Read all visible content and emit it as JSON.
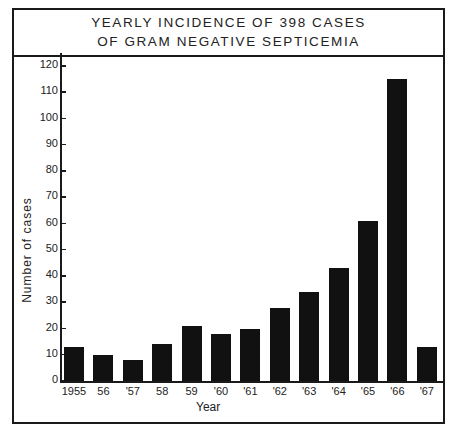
{
  "chart_data": {
    "type": "bar",
    "title": "YEARLY INCIDENCE OF 398 CASES OF GRAM NEGATIVE SEPTICEMIA",
    "title_lines": [
      "YEARLY  INCIDENCE  OF  398  CASES",
      "OF  GRAM  NEGATIVE  SEPTICEMIA"
    ],
    "xlabel": "Year",
    "ylabel": "Number  of  cases",
    "categories": [
      "1955",
      "56",
      "'57",
      "58",
      "59",
      "'60",
      "'61",
      "'62",
      "'63",
      "'64",
      "'65",
      "'66",
      "'67"
    ],
    "years": [
      1955,
      1956,
      1957,
      1958,
      1959,
      1960,
      1961,
      1962,
      1963,
      1964,
      1965,
      1966,
      1967
    ],
    "values": [
      13,
      10,
      8,
      14,
      21,
      18,
      20,
      28,
      34,
      43,
      61,
      115,
      13
    ],
    "ylim": [
      0,
      120
    ],
    "yticks": [
      "0",
      "10",
      "20",
      "30",
      "40",
      "50",
      "60",
      "70",
      "80",
      "90",
      "100",
      "110",
      "120"
    ],
    "grid": false,
    "legend": null,
    "bar_color": "#111111"
  }
}
